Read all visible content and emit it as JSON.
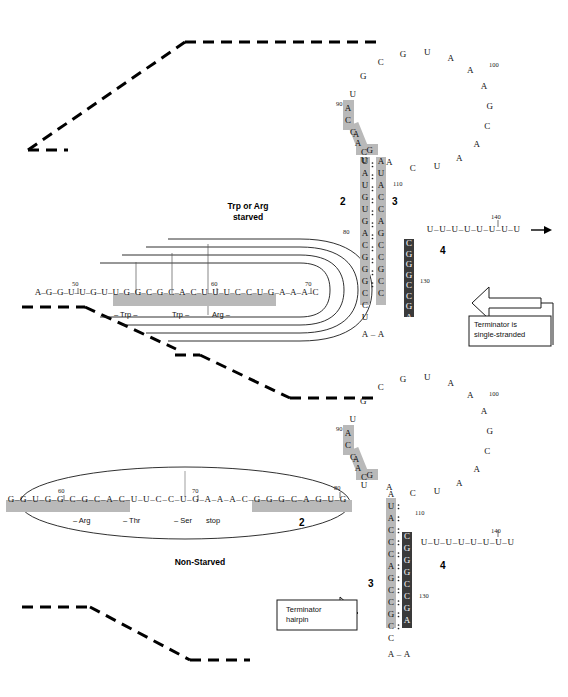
{
  "figure": {
    "type": "molecular-diagram",
    "colors": {
      "background": "#ffffff",
      "text": "#111111",
      "shade_light": "#b9b9b9",
      "shade_dark": "#3a3a3a",
      "line": "#000000"
    }
  },
  "panels": [
    {
      "id": "starved",
      "label": "Trp or Arg\nstarved",
      "label_line1": "Trp or Arg",
      "label_line2": "starved",
      "ribosome_style": "stalled-nested-arcs",
      "callout": {
        "line1": "Terminator is",
        "line2": "single-stranded"
      },
      "linear_sequence": {
        "start_number": 50,
        "numbers": [
          50,
          60,
          70
        ],
        "bases": [
          "A",
          "G",
          "G",
          "U",
          "U",
          "G",
          "U",
          "U",
          "G",
          "G",
          "C",
          "G",
          "C",
          "A",
          "C",
          "U",
          "U",
          "U",
          "C",
          "C",
          "U",
          "G",
          "A",
          "A",
          "A",
          "C"
        ],
        "shaded_from_index": 5,
        "shaded_to_index": 17,
        "codon_labels": [
          "– Trp –",
          "Trp –",
          "Arg –"
        ]
      },
      "loop": {
        "numbers": [
          90,
          100
        ],
        "left_stem_bases": [
          "A",
          "C",
          "C",
          "A",
          "C",
          "U"
        ],
        "loop_bases": [
          "U",
          "G",
          "C",
          "G",
          "U",
          "A",
          "A",
          "A",
          "G",
          "C",
          "A",
          "A",
          "U",
          "C",
          "A",
          "G",
          "A"
        ]
      },
      "hairpin_2_3": {
        "region_left_label": "2",
        "region_right_label": "3",
        "left_strand": [
          "U",
          "A",
          "U",
          "G",
          "U",
          "G",
          "A",
          "C",
          "G",
          "G",
          "G",
          "C",
          "C",
          "U"
        ],
        "right_strand": [
          "A",
          "U",
          "A",
          "C",
          "C",
          "A",
          "G",
          "C",
          "C",
          "G",
          "C",
          "C"
        ],
        "left_numbers": [
          80
        ],
        "right_numbers": [
          110
        ],
        "bottom_bases": [
          "A",
          "A"
        ]
      },
      "region_4": {
        "label": "4",
        "bases": [
          "C",
          "G",
          "G",
          "G",
          "C",
          "C",
          "G",
          "A"
        ],
        "number": 130
      },
      "poly_u": {
        "bases": [
          "U",
          "U",
          "U",
          "U",
          "U",
          "U",
          "U",
          "U"
        ],
        "number": 140,
        "arrow": true
      }
    },
    {
      "id": "non-starved",
      "label": "Non-Starved",
      "ribosome_style": "moving-single-ellipse",
      "callout": {
        "line1": "Terminator",
        "line2": "hairpin"
      },
      "linear_sequence": {
        "start_number": 60,
        "numbers": [
          60,
          70,
          80
        ],
        "bases": [
          "G",
          "G",
          "U",
          "G",
          "G",
          "C",
          "G",
          "C",
          "A",
          "C",
          "U",
          "U",
          "C",
          "C",
          "U",
          "G",
          "A",
          "A",
          "A",
          "C",
          "G",
          "G",
          "G",
          "C",
          "A",
          "G",
          "U",
          "G"
        ],
        "shaded_runs": [
          [
            0,
            9
          ],
          [
            20,
            27
          ]
        ],
        "codon_labels": [
          "– Arg",
          "– Thr",
          "– Ser",
          "stop"
        ],
        "region_label": "2"
      },
      "loop": {
        "numbers": [
          90,
          100
        ],
        "left_stem_bases": [
          "A",
          "C",
          "C",
          "A",
          "C",
          "U"
        ],
        "loop_bases": [
          "U",
          "G",
          "C",
          "G",
          "U",
          "A",
          "A",
          "A",
          "G",
          "C",
          "A",
          "A",
          "U",
          "C",
          "A",
          "G",
          "A"
        ]
      },
      "hairpin_3_4": {
        "region_left_label": "3",
        "region_right_label": "4",
        "left_strand": [
          "A",
          "U",
          "A",
          "C",
          "C",
          "C",
          "A",
          "G",
          "C",
          "C",
          "G",
          "C",
          "C"
        ],
        "right_strand": [
          "C",
          "G",
          "G",
          "G",
          "C",
          "C",
          "G",
          "A"
        ],
        "left_numbers": [
          110
        ],
        "right_numbers": [
          130
        ],
        "bottom_bases": [
          "A",
          "A"
        ]
      },
      "poly_u": {
        "bases": [
          "U",
          "U",
          "U",
          "U",
          "U",
          "U",
          "U",
          "U"
        ],
        "number": 140
      }
    }
  ]
}
